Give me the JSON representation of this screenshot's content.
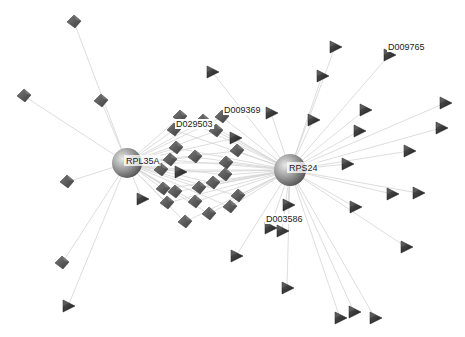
{
  "diagram": {
    "type": "network",
    "background": "#ffffff",
    "edge_color": "#d4d4d4",
    "colors": {
      "hub": "#8a8a8a",
      "cube": "#5a5a5a",
      "triangle": "#2e2e2e"
    },
    "hubs": [
      {
        "id": "RPL35A",
        "label": "RPL35A",
        "x": 127,
        "y": 163,
        "r": 15
      },
      {
        "id": "RPS24",
        "label": "RPS24",
        "x": 290,
        "y": 170,
        "r": 16
      }
    ],
    "labeled_nodes": [
      {
        "label": "D029503",
        "x": 176,
        "y": 127
      },
      {
        "label": "D009369",
        "x": 224,
        "y": 113
      },
      {
        "label": "D009765",
        "x": 388,
        "y": 50
      },
      {
        "label": "D003586",
        "x": 266,
        "y": 222
      }
    ],
    "nodes": [
      {
        "shape": "cube",
        "x": 74,
        "y": 22,
        "links": [
          0
        ]
      },
      {
        "shape": "cube",
        "x": 24,
        "y": 96,
        "links": [
          0
        ]
      },
      {
        "shape": "cube",
        "x": 101,
        "y": 101,
        "links": [
          0
        ]
      },
      {
        "shape": "cube",
        "x": 67,
        "y": 182,
        "links": [
          0
        ]
      },
      {
        "shape": "cube",
        "x": 62,
        "y": 263,
        "links": [
          0
        ]
      },
      {
        "shape": "tri",
        "x": 68,
        "y": 306,
        "links": [
          0
        ]
      },
      {
        "shape": "tri",
        "x": 142,
        "y": 199,
        "links": [
          0
        ]
      },
      {
        "shape": "cube",
        "x": 180,
        "y": 117,
        "links": [
          0,
          1
        ]
      },
      {
        "shape": "cube",
        "x": 174,
        "y": 130,
        "links": [
          0,
          1
        ]
      },
      {
        "shape": "cube",
        "x": 203,
        "y": 121,
        "links": [
          0,
          1
        ]
      },
      {
        "shape": "cube",
        "x": 216,
        "y": 131,
        "links": [
          0,
          1
        ]
      },
      {
        "shape": "cube",
        "x": 222,
        "y": 117,
        "links": [
          0,
          1
        ]
      },
      {
        "shape": "tri",
        "x": 235,
        "y": 138,
        "links": [
          0,
          1
        ]
      },
      {
        "shape": "cube",
        "x": 237,
        "y": 151,
        "links": [
          0,
          1
        ]
      },
      {
        "shape": "cube",
        "x": 176,
        "y": 148,
        "links": [
          0,
          1
        ]
      },
      {
        "shape": "cube",
        "x": 170,
        "y": 160,
        "links": [
          0,
          1
        ]
      },
      {
        "shape": "cube",
        "x": 161,
        "y": 170,
        "links": [
          0,
          1
        ]
      },
      {
        "shape": "tri",
        "x": 180,
        "y": 172,
        "links": [
          0,
          1
        ]
      },
      {
        "shape": "cube",
        "x": 195,
        "y": 157,
        "links": [
          0,
          1
        ]
      },
      {
        "shape": "cube",
        "x": 226,
        "y": 163,
        "links": [
          0,
          1
        ]
      },
      {
        "shape": "cube",
        "x": 225,
        "y": 175,
        "links": [
          0,
          1
        ]
      },
      {
        "shape": "cube",
        "x": 163,
        "y": 189,
        "links": [
          0,
          1
        ]
      },
      {
        "shape": "cube",
        "x": 175,
        "y": 192,
        "links": [
          0,
          1
        ]
      },
      {
        "shape": "cube",
        "x": 167,
        "y": 203,
        "links": [
          0,
          1
        ]
      },
      {
        "shape": "cube",
        "x": 199,
        "y": 188,
        "links": [
          0,
          1
        ]
      },
      {
        "shape": "cube",
        "x": 213,
        "y": 183,
        "links": [
          0,
          1
        ]
      },
      {
        "shape": "cube",
        "x": 195,
        "y": 202,
        "links": [
          0,
          1
        ]
      },
      {
        "shape": "cube",
        "x": 209,
        "y": 214,
        "links": [
          0,
          1
        ]
      },
      {
        "shape": "cube",
        "x": 185,
        "y": 222,
        "links": [
          0,
          1
        ]
      },
      {
        "shape": "cube",
        "x": 238,
        "y": 196,
        "links": [
          0,
          1
        ]
      },
      {
        "shape": "cube",
        "x": 230,
        "y": 207,
        "links": [
          0,
          1
        ]
      },
      {
        "shape": "tri",
        "x": 212,
        "y": 72,
        "links": [
          1
        ]
      },
      {
        "shape": "tri",
        "x": 335,
        "y": 47,
        "links": [
          1
        ]
      },
      {
        "shape": "tri",
        "x": 389,
        "y": 55,
        "links": [
          1
        ]
      },
      {
        "shape": "tri",
        "x": 322,
        "y": 76,
        "links": [
          1
        ]
      },
      {
        "shape": "tri",
        "x": 271,
        "y": 113,
        "links": [
          1
        ]
      },
      {
        "shape": "tri",
        "x": 313,
        "y": 120,
        "links": [
          1
        ]
      },
      {
        "shape": "tri",
        "x": 365,
        "y": 110,
        "links": [
          1
        ]
      },
      {
        "shape": "tri",
        "x": 359,
        "y": 131,
        "links": [
          1
        ]
      },
      {
        "shape": "tri",
        "x": 445,
        "y": 103,
        "links": [
          1
        ]
      },
      {
        "shape": "tri",
        "x": 441,
        "y": 128,
        "links": [
          1
        ]
      },
      {
        "shape": "tri",
        "x": 409,
        "y": 151,
        "links": [
          1
        ]
      },
      {
        "shape": "tri",
        "x": 347,
        "y": 164,
        "links": [
          1
        ]
      },
      {
        "shape": "tri",
        "x": 392,
        "y": 194,
        "links": [
          1
        ]
      },
      {
        "shape": "tri",
        "x": 418,
        "y": 193,
        "links": [
          1
        ]
      },
      {
        "shape": "tri",
        "x": 355,
        "y": 207,
        "links": [
          1
        ]
      },
      {
        "shape": "tri",
        "x": 406,
        "y": 247,
        "links": [
          1
        ]
      },
      {
        "shape": "tri",
        "x": 288,
        "y": 205,
        "links": [
          1
        ]
      },
      {
        "shape": "tri",
        "x": 270,
        "y": 228,
        "links": [
          1
        ]
      },
      {
        "shape": "tri",
        "x": 282,
        "y": 231,
        "links": [
          1
        ]
      },
      {
        "shape": "tri",
        "x": 236,
        "y": 256,
        "links": [
          1
        ]
      },
      {
        "shape": "tri",
        "x": 287,
        "y": 288,
        "links": [
          1
        ]
      },
      {
        "shape": "tri",
        "x": 340,
        "y": 318,
        "links": [
          1
        ]
      },
      {
        "shape": "tri",
        "x": 354,
        "y": 312,
        "links": [
          1
        ]
      },
      {
        "shape": "tri",
        "x": 375,
        "y": 318,
        "links": [
          1
        ]
      }
    ]
  }
}
